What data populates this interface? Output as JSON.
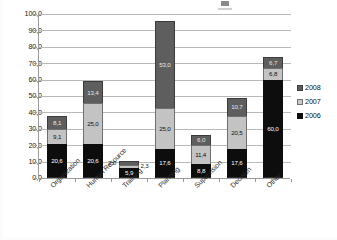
{
  "chart_data": {
    "type": "bar",
    "stacked": true,
    "title": "",
    "xlabel": "",
    "ylabel": "",
    "ylim": [
      0.0,
      100.0
    ],
    "ytick_step": 10.0,
    "decimal_separator": ",",
    "grid": true,
    "legend_position": "right",
    "categories": [
      "Organization",
      "Human Resource",
      "Training",
      "Planning",
      "Supervision",
      "Decision",
      "Other"
    ],
    "ytick_labels": [
      "100,0",
      "90,0",
      "80,0",
      "70,0",
      "60,0",
      "50,0",
      "40,0",
      "30,0",
      "20,0",
      "10,0",
      "0,0"
    ],
    "series": [
      {
        "name": "2006",
        "color": "#0d0d0d",
        "values": [
          20.6,
          20.6,
          5.9,
          17.6,
          8.8,
          17.6,
          60.0
        ],
        "labels": [
          "20,6",
          "20,6",
          "5,9",
          "17,6",
          "8,8",
          "17,6",
          "60,0"
        ]
      },
      {
        "name": "2007",
        "color": "#c3c3c3",
        "values": [
          9.1,
          25.0,
          2.3,
          25.0,
          11.4,
          20.5,
          6.8
        ],
        "labels": [
          "9,1",
          "25,0",
          "2,3",
          "25,0",
          "11,4",
          "20,5",
          "6,8"
        ]
      },
      {
        "name": "2008",
        "color": "#5e5e5e",
        "values": [
          8.1,
          13.4,
          2.0,
          53.0,
          6.0,
          10.7,
          6.7
        ],
        "labels": [
          "8,1",
          "13,4",
          "2,0",
          "53,0",
          "6,0",
          "10,7",
          "6,7"
        ]
      }
    ],
    "totals": [
      37.8,
      59.0,
      10.2,
      95.6,
      26.2,
      48.8,
      73.5
    ]
  },
  "legend": {
    "entries": [
      {
        "label": "2008",
        "color": "#5e5e5e"
      },
      {
        "label": "2007",
        "color": "#c9c9c9"
      },
      {
        "label": "2006",
        "color": "#0d0d0d"
      }
    ]
  }
}
